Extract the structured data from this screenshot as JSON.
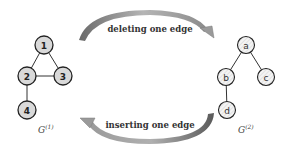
{
  "diagram": {
    "graph1": {
      "label": "G",
      "superscript": "(1)",
      "nodes": [
        {
          "id": "1",
          "x": 44,
          "y": 45
        },
        {
          "id": "2",
          "x": 27,
          "y": 76
        },
        {
          "id": "3",
          "x": 63,
          "y": 76
        },
        {
          "id": "4",
          "x": 27,
          "y": 110
        }
      ],
      "edges": [
        [
          "1",
          "2"
        ],
        [
          "1",
          "3"
        ],
        [
          "2",
          "3"
        ],
        [
          "2",
          "4"
        ]
      ],
      "node_fill": "#d9d9d9"
    },
    "graph2": {
      "label": "G",
      "superscript": "(2)",
      "nodes": [
        {
          "id": "a",
          "x": 246,
          "y": 45
        },
        {
          "id": "b",
          "x": 226,
          "y": 77
        },
        {
          "id": "c",
          "x": 266,
          "y": 77
        },
        {
          "id": "d",
          "x": 227,
          "y": 110
        }
      ],
      "edges": [
        [
          "a",
          "b"
        ],
        [
          "a",
          "c"
        ],
        [
          "b",
          "d"
        ]
      ],
      "node_fill": "#f2f2f2"
    },
    "top_arrow": {
      "label": "deleting  one edge",
      "direction": "right"
    },
    "bottom_arrow": {
      "label": "inserting one edge",
      "direction": "left"
    },
    "colors": {
      "arrow": "#8a8a8a",
      "arrow_dark": "#5a5a5a",
      "node_stroke": "#222222",
      "edge": "#333333"
    }
  }
}
